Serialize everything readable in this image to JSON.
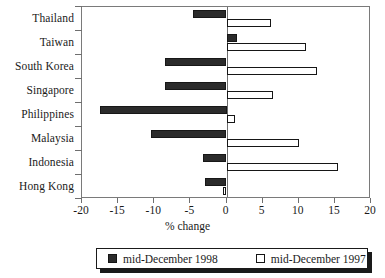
{
  "chart_data": {
    "type": "bar",
    "orientation": "horizontal",
    "title": "",
    "subtitle": "",
    "xlabel": "% change",
    "ylabel": "",
    "xlim": [
      -20,
      20
    ],
    "xticks": [
      -20,
      -15,
      -10,
      -5,
      0,
      5,
      10,
      15,
      20
    ],
    "xtick_labels": [
      "-20",
      "-15",
      "-10",
      "-5",
      "0",
      "5",
      "10",
      "15",
      "20"
    ],
    "grid": false,
    "legend_position": "bottom",
    "categories": [
      "Thailand",
      "Taiwan",
      "South Korea",
      "Singapore",
      "Philippines",
      "Malaysia",
      "Indonesia",
      "Hong Kong"
    ],
    "series": [
      {
        "name": "mid-December 1998",
        "style": "filled",
        "color": "#2b2b2b",
        "values": [
          -4.7,
          1.5,
          -8.5,
          -8.5,
          -17.5,
          -10.5,
          -3.3,
          -3.0
        ]
      },
      {
        "name": "mid-December 1997",
        "style": "open",
        "color": "#ffffff",
        "values": [
          6.2,
          11.0,
          12.5,
          6.5,
          1.2,
          10.0,
          15.5,
          -0.5
        ]
      }
    ],
    "annotations": []
  },
  "legend": {
    "entries": [
      {
        "label": "mid-December 1998",
        "swatch": "filled-square"
      },
      {
        "label": "mid-December 1997",
        "swatch": "open-square"
      }
    ]
  },
  "colors": {
    "series_1998": "#2b2b2b",
    "series_1997": "#ffffff",
    "axis": "#6f6f6f",
    "text": "#1a1a1a",
    "background": "#ffffff"
  }
}
